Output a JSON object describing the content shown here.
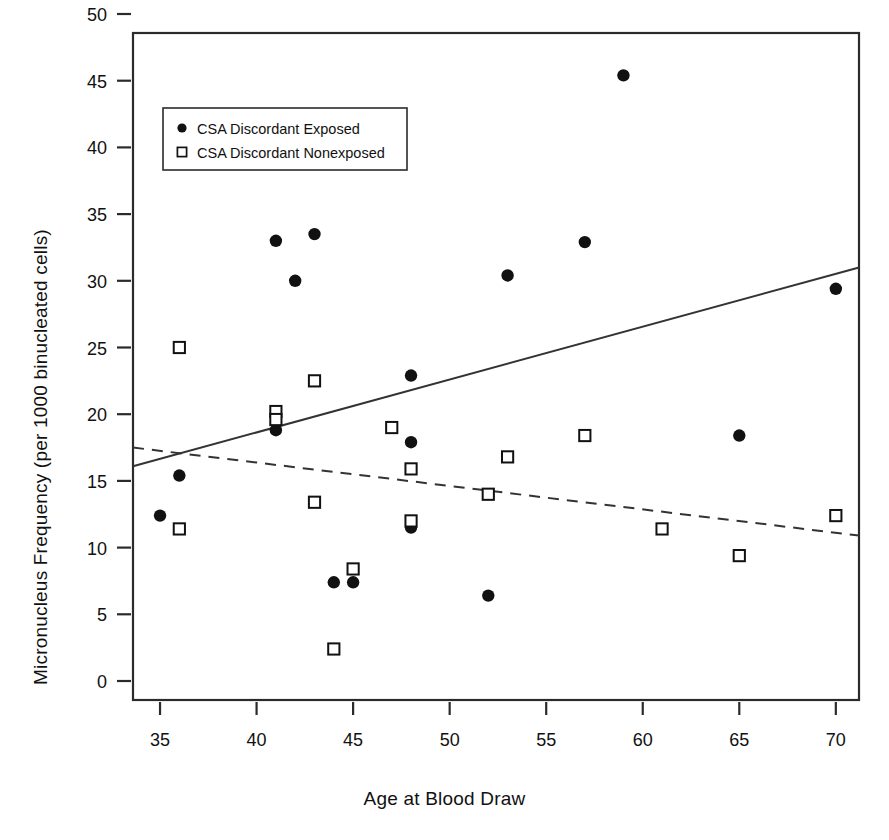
{
  "chart_data": {
    "type": "scatter",
    "title": "",
    "xlabel": "Age at Blood Draw",
    "ylabel": "Micronucleus Frequency (per 1000 binucleated cells)",
    "xlim": [
      33.6,
      71.2
    ],
    "ylim": [
      0,
      50
    ],
    "xticks": [
      35,
      40,
      45,
      50,
      55,
      60,
      65,
      70
    ],
    "yticks": [
      0,
      5,
      10,
      15,
      20,
      25,
      30,
      35,
      40,
      45,
      50
    ],
    "grid": false,
    "legend_position": "top-left",
    "legend": [
      {
        "label": "CSA Discordant Exposed",
        "marker": "filled-circle"
      },
      {
        "label": "CSA Discordant Nonexposed",
        "marker": "open-square"
      }
    ],
    "series": [
      {
        "name": "CSA Discordant Exposed",
        "marker": "filled-circle",
        "points": [
          {
            "x": 35,
            "y": 12.4
          },
          {
            "x": 36,
            "y": 15.4
          },
          {
            "x": 41,
            "y": 18.8
          },
          {
            "x": 41,
            "y": 33.0
          },
          {
            "x": 42,
            "y": 30.0
          },
          {
            "x": 43,
            "y": 33.5
          },
          {
            "x": 44,
            "y": 7.4
          },
          {
            "x": 45,
            "y": 7.4
          },
          {
            "x": 48,
            "y": 11.5
          },
          {
            "x": 48,
            "y": 17.9
          },
          {
            "x": 48,
            "y": 22.9
          },
          {
            "x": 52,
            "y": 6.4
          },
          {
            "x": 53,
            "y": 30.4
          },
          {
            "x": 57,
            "y": 32.9
          },
          {
            "x": 59,
            "y": 45.4
          },
          {
            "x": 65,
            "y": 18.4
          },
          {
            "x": 70,
            "y": 29.4
          }
        ]
      },
      {
        "name": "CSA Discordant Nonexposed",
        "marker": "open-square",
        "points": [
          {
            "x": 36,
            "y": 25.0
          },
          {
            "x": 36,
            "y": 11.4
          },
          {
            "x": 41,
            "y": 20.2
          },
          {
            "x": 41,
            "y": 19.6
          },
          {
            "x": 43,
            "y": 22.5
          },
          {
            "x": 43,
            "y": 13.4
          },
          {
            "x": 44,
            "y": 2.4
          },
          {
            "x": 45,
            "y": 8.4
          },
          {
            "x": 47,
            "y": 19.0
          },
          {
            "x": 48,
            "y": 15.9
          },
          {
            "x": 48,
            "y": 12.0
          },
          {
            "x": 52,
            "y": 14.0
          },
          {
            "x": 53,
            "y": 16.8
          },
          {
            "x": 57,
            "y": 18.4
          },
          {
            "x": 61,
            "y": 11.4
          },
          {
            "x": 65,
            "y": 9.4
          },
          {
            "x": 70,
            "y": 12.4
          }
        ]
      }
    ],
    "trend_lines": [
      {
        "name": "Exposed regression",
        "style": "solid",
        "x0": 33.6,
        "y0": 16.1,
        "x1": 71.2,
        "y1": 31.0
      },
      {
        "name": "Nonexposed regression",
        "style": "dashed",
        "x0": 33.6,
        "y0": 17.5,
        "x1": 71.2,
        "y1": 10.9
      }
    ]
  }
}
